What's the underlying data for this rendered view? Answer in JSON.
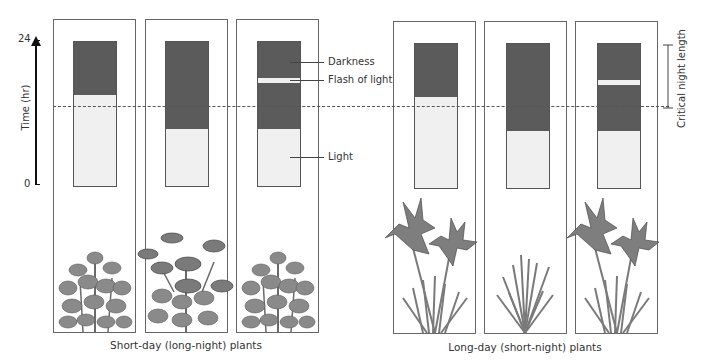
{
  "axis": {
    "label": "Time (hr)",
    "tick_top": "24",
    "tick_bottom": "0"
  },
  "annotations": {
    "darkness": "Darkness",
    "flash": "Flash of light",
    "light": "Light",
    "critical": "Critical night length"
  },
  "groups": [
    {
      "caption": "Short-day (long-night) plants",
      "plant": "chrysanthemum",
      "panels": [
        {
          "condition": "long night",
          "flowering": false
        },
        {
          "condition": "short night",
          "flowering": true
        },
        {
          "condition": "long night interrupted by flash",
          "flowering": false
        }
      ]
    },
    {
      "caption": "Long-day (short-night) plants",
      "plant": "iris",
      "panels": [
        {
          "condition": "long night... short dark",
          "flowering": true
        },
        {
          "condition": "long night",
          "flowering": false
        },
        {
          "condition": "long night interrupted by flash",
          "flowering": true
        }
      ]
    }
  ],
  "colors": {
    "darkness": "#5b5b5b",
    "light": "#f0f0f0",
    "border": "#666666"
  }
}
